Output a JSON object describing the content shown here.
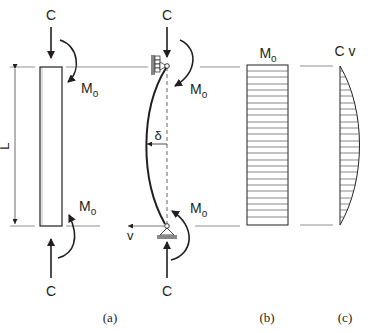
{
  "figure": {
    "panel_a": {
      "caption": "(a)",
      "top_load": "C",
      "bottom_load": "C",
      "top_moment": "M",
      "top_moment_sub": "o",
      "bottom_moment": "M",
      "bottom_moment_sub": "o",
      "length_label": "L"
    },
    "panel_deflected": {
      "top_load": "C",
      "bottom_load": "C",
      "top_moment": "M",
      "top_moment_sub": "o",
      "bottom_moment": "M",
      "bottom_moment_sub": "o",
      "deflection_label": "δ",
      "direction_label": "v"
    },
    "panel_b": {
      "caption": "(b)",
      "title": "M",
      "title_sub": "o"
    },
    "panel_c": {
      "caption": "(c)",
      "title": "C v"
    }
  }
}
